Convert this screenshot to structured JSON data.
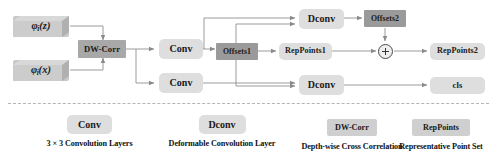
{
  "figure": {
    "type": "flow-diagram"
  },
  "nodes": {
    "phi_z": {
      "label_prefix": "φ",
      "label_sub": "i",
      "label_suffix": "(z)",
      "style": "input-3d"
    },
    "phi_x": {
      "label_prefix": "φ",
      "label_sub": "i",
      "label_suffix": "(x)",
      "style": "input-3d"
    },
    "dw_corr": {
      "label": "DW-Corr",
      "style": "dark"
    },
    "conv_top": {
      "label": "Conv",
      "style": "light"
    },
    "conv_bottom": {
      "label": "Conv",
      "style": "light"
    },
    "offsets1": {
      "label": "Offsets1",
      "style": "dark"
    },
    "dconv_top": {
      "label": "Dconv",
      "style": "light"
    },
    "dconv_bottom": {
      "label": "Dconv",
      "style": "light"
    },
    "offsets2": {
      "label": "Offsets2",
      "style": "dark"
    },
    "reppoints1": {
      "label": "RepPoints1",
      "style": "light"
    },
    "reppoints2": {
      "label": "RepPoints2",
      "style": "light"
    },
    "cls": {
      "label": "cls",
      "style": "light"
    },
    "adder": {
      "label": "+",
      "style": "circle-plus"
    }
  },
  "legend": [
    {
      "chip": "Conv",
      "chip_style": "light",
      "caption": "3 × 3 Convolution Layers"
    },
    {
      "chip": "Dconv",
      "chip_style": "light",
      "caption": "Deformable Convolution Layer"
    },
    {
      "chip": "DW-Corr",
      "chip_style": "dark",
      "caption": "Depth-wise Cross Correlation"
    },
    {
      "chip": "RepPoints",
      "chip_style": "dark",
      "caption": "Representative Point Set"
    }
  ],
  "colors": {
    "block_light": "#dedede",
    "block_dark": "#9a9a9a",
    "block_input": "#c9c9c9",
    "wire": "#8a8a8a",
    "text": "#1a1a1a",
    "divider": "#b4b4b4",
    "background": "#ffffff"
  }
}
